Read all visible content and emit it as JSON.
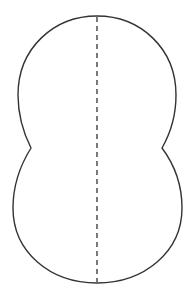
{
  "figure": {
    "colors": {
      "background": "#ffffff",
      "outline": "#333333",
      "symmetry_line": "#333333"
    }
  }
}
